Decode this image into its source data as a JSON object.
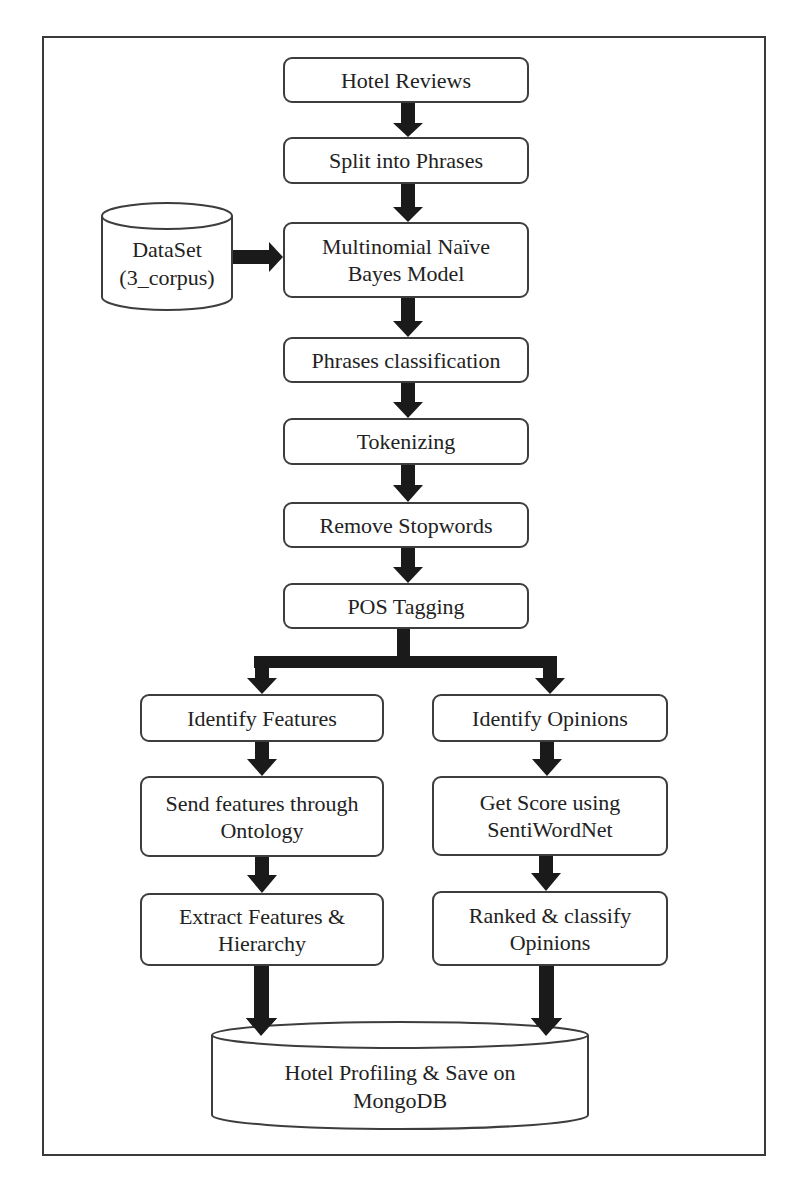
{
  "diagram": {
    "type": "flowchart",
    "title": "",
    "nodes": [
      {
        "id": "hotel_reviews",
        "label": "Hotel Reviews",
        "shape": "rounded-rect"
      },
      {
        "id": "split_phrases",
        "label": "Split into Phrases",
        "shape": "rounded-rect"
      },
      {
        "id": "dataset",
        "label_line1": "DataSet",
        "label_line2": "(3_corpus)",
        "shape": "cylinder"
      },
      {
        "id": "mnb_model",
        "label_line1": "Multinomial Naïve",
        "label_line2": "Bayes Model",
        "shape": "rounded-rect"
      },
      {
        "id": "phrases_classification",
        "label": "Phrases classification",
        "shape": "rounded-rect"
      },
      {
        "id": "tokenizing",
        "label": "Tokenizing",
        "shape": "rounded-rect"
      },
      {
        "id": "remove_stopwords",
        "label": "Remove Stopwords",
        "shape": "rounded-rect"
      },
      {
        "id": "pos_tagging",
        "label": "POS Tagging",
        "shape": "rounded-rect"
      },
      {
        "id": "identify_features",
        "label": "Identify Features",
        "shape": "rounded-rect"
      },
      {
        "id": "identify_opinions",
        "label": "Identify Opinions",
        "shape": "rounded-rect"
      },
      {
        "id": "send_features",
        "label_line1": "Send features through",
        "label_line2": "Ontology",
        "shape": "rounded-rect"
      },
      {
        "id": "get_score",
        "label_line1": "Get Score using",
        "label_line2": "SentiWordNet",
        "shape": "rounded-rect"
      },
      {
        "id": "extract_features",
        "label_line1": "Extract Features &",
        "label_line2": "Hierarchy",
        "shape": "rounded-rect"
      },
      {
        "id": "ranked_classify",
        "label_line1": "Ranked & classify",
        "label_line2": "Opinions",
        "shape": "rounded-rect"
      },
      {
        "id": "hotel_profiling",
        "label_line1": "Hotel Profiling & Save on",
        "label_line2": "MongoDB",
        "shape": "cylinder"
      }
    ],
    "edges": [
      {
        "from": "hotel_reviews",
        "to": "split_phrases"
      },
      {
        "from": "split_phrases",
        "to": "mnb_model"
      },
      {
        "from": "dataset",
        "to": "mnb_model"
      },
      {
        "from": "mnb_model",
        "to": "phrases_classification"
      },
      {
        "from": "phrases_classification",
        "to": "tokenizing"
      },
      {
        "from": "tokenizing",
        "to": "remove_stopwords"
      },
      {
        "from": "remove_stopwords",
        "to": "pos_tagging"
      },
      {
        "from": "pos_tagging",
        "to": "identify_features"
      },
      {
        "from": "pos_tagging",
        "to": "identify_opinions"
      },
      {
        "from": "identify_features",
        "to": "send_features"
      },
      {
        "from": "send_features",
        "to": "extract_features"
      },
      {
        "from": "extract_features",
        "to": "hotel_profiling"
      },
      {
        "from": "identify_opinions",
        "to": "get_score"
      },
      {
        "from": "get_score",
        "to": "ranked_classify"
      },
      {
        "from": "ranked_classify",
        "to": "hotel_profiling"
      }
    ],
    "colors": {
      "stroke": "#3d3d3d",
      "arrow": "#1a1a1a",
      "background": "#ffffff"
    }
  }
}
